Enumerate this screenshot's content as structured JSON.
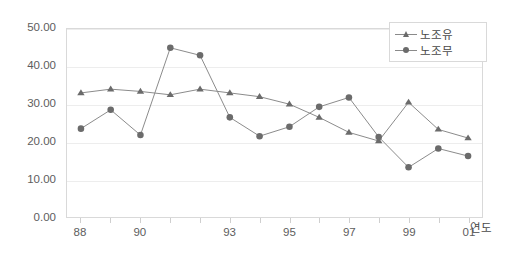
{
  "chart_data": {
    "type": "line",
    "title": "",
    "xlabel": "연도",
    "ylabel": "",
    "x": [
      1988,
      1989,
      1990,
      1991,
      1992,
      1993,
      1994,
      1995,
      1996,
      1997,
      1998,
      1999,
      2000,
      2001
    ],
    "categories": [
      "88",
      "89",
      "90",
      "91",
      "92",
      "93",
      "94",
      "95",
      "96",
      "97",
      "98",
      "99",
      "00",
      "01"
    ],
    "xtick_labels": [
      "88",
      "90",
      "93",
      "95",
      "97",
      "99",
      "01"
    ],
    "xtick_indices": [
      0,
      2,
      5,
      7,
      9,
      11,
      13
    ],
    "ytick_labels": [
      "0.00",
      "10.00",
      "20.00",
      "30.00",
      "40.00",
      "50.00"
    ],
    "ytick_values": [
      0,
      10,
      20,
      30,
      40,
      50
    ],
    "ylim": [
      0,
      50
    ],
    "grid": true,
    "legend_position": "top-right",
    "series": [
      {
        "name": "노조유",
        "marker": "triangle",
        "color": "#6b6b6b",
        "values": [
          33.0,
          34.0,
          33.4,
          32.5,
          34.0,
          33.0,
          32.0,
          30.0,
          26.5,
          22.5,
          20.2,
          30.5,
          23.3,
          21.0
        ]
      },
      {
        "name": "노조무",
        "marker": "circle",
        "color": "#6b6b6b",
        "values": [
          23.5,
          28.5,
          21.8,
          45.0,
          43.0,
          26.5,
          21.5,
          24.0,
          29.3,
          31.8,
          21.3,
          13.2,
          18.2,
          16.2
        ]
      }
    ]
  },
  "legend": {
    "items": [
      {
        "label": "노조유",
        "marker": "triangle"
      },
      {
        "label": "노조무",
        "marker": "circle"
      }
    ]
  },
  "axis": {
    "x_title": "연도"
  },
  "colors": {
    "line": "#8a8a8a",
    "marker": "#6b6b6b",
    "grid": "#ededed",
    "frame": "#d9d9d9",
    "text": "#5d5d5d"
  }
}
